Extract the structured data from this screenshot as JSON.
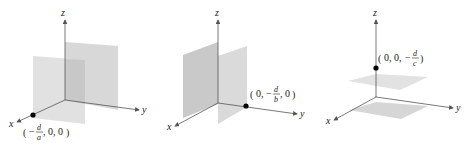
{
  "panels": [
    {
      "id": "x-plane",
      "axes": {
        "x": "x",
        "y": "y",
        "z": "z"
      },
      "point_label": {
        "open": "(",
        "neg": "−",
        "num": "d",
        "den": "a",
        "rest": ", 0, 0",
        "close": ")"
      },
      "description": "Plane parallel to yz-plane intersecting x-axis at (-d/a, 0, 0)"
    },
    {
      "id": "y-plane",
      "axes": {
        "x": "x",
        "y": "y",
        "z": "z"
      },
      "point_label": {
        "open": "(",
        "pre": "0, ",
        "neg": "−",
        "num": "d",
        "den": "b",
        "rest": ", 0",
        "close": ")"
      },
      "description": "Plane parallel to xz-plane intersecting y-axis at (0, -d/b, 0)"
    },
    {
      "id": "z-plane",
      "axes": {
        "x": "x",
        "y": "y",
        "z": "z"
      },
      "point_label": {
        "open": "(",
        "pre": "0, 0, ",
        "neg": "−",
        "num": "d",
        "den": "c",
        "close": ")"
      },
      "description": "Plane parallel to xy-plane intersecting z-axis at (0, 0, -d/c)"
    }
  ],
  "colors": {
    "plane_light": "#d9d9d9",
    "plane_dark": "#c4c4c4",
    "axis": "#555555",
    "point": "#000000"
  }
}
